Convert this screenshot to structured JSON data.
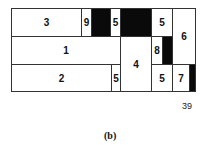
{
  "diagram": {
    "cells": [
      {
        "label": "3",
        "x": 11,
        "y": 8,
        "w": 71,
        "h": 29,
        "filled": false
      },
      {
        "label": "9",
        "x": 81,
        "y": 8,
        "w": 11,
        "h": 29,
        "filled": false
      },
      {
        "label": "",
        "x": 91,
        "y": 8,
        "w": 20,
        "h": 29,
        "filled": true
      },
      {
        "label": "5",
        "x": 110,
        "y": 8,
        "w": 11,
        "h": 29,
        "filled": false
      },
      {
        "label": "",
        "x": 120,
        "y": 8,
        "w": 32,
        "h": 29,
        "filled": true
      },
      {
        "label": "5",
        "x": 151,
        "y": 8,
        "w": 22,
        "h": 29,
        "filled": false
      },
      {
        "label": "6",
        "x": 172,
        "y": 8,
        "w": 24,
        "h": 57,
        "filled": false
      },
      {
        "label": "1",
        "x": 11,
        "y": 36,
        "w": 110,
        "h": 29,
        "filled": false
      },
      {
        "label": "4",
        "x": 120,
        "y": 36,
        "w": 32,
        "h": 56,
        "filled": false
      },
      {
        "label": "8",
        "x": 151,
        "y": 36,
        "w": 12,
        "h": 29,
        "filled": false
      },
      {
        "label": "",
        "x": 162,
        "y": 36,
        "w": 11,
        "h": 29,
        "filled": true
      },
      {
        "label": "2",
        "x": 11,
        "y": 64,
        "w": 101,
        "h": 28,
        "filled": false
      },
      {
        "label": "5",
        "x": 111,
        "y": 64,
        "w": 10,
        "h": 28,
        "filled": false
      },
      {
        "label": "5",
        "x": 151,
        "y": 64,
        "w": 22,
        "h": 28,
        "filled": false
      },
      {
        "label": "7",
        "x": 172,
        "y": 64,
        "w": 18,
        "h": 28,
        "filled": false
      },
      {
        "label": "",
        "x": 189,
        "y": 64,
        "w": 7,
        "h": 28,
        "filled": true
      }
    ],
    "width_label": "39",
    "caption": "(b)"
  }
}
